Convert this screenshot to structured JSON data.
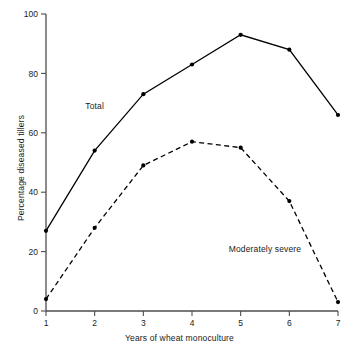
{
  "chart_data": {
    "type": "line",
    "title": "",
    "xlabel": "Years of wheat monoculture",
    "ylabel": "Percentage diseased tillers",
    "x": [
      1,
      2,
      3,
      4,
      5,
      6,
      7
    ],
    "xticklabels": [
      "1",
      "2",
      "3",
      "4",
      "5",
      "6",
      "7"
    ],
    "yticks": [
      0,
      20,
      40,
      60,
      80,
      100
    ],
    "yticklabels": [
      "0",
      "20",
      "40",
      "60",
      "80",
      "100"
    ],
    "xlim": [
      1,
      7
    ],
    "ylim": [
      0,
      100
    ],
    "grid": false,
    "legend_position": "inline-annotation",
    "series": [
      {
        "name": "Total",
        "values": [
          27,
          54,
          73,
          83,
          93,
          88,
          66
        ],
        "linestyle": "solid",
        "marker": "filled-circle",
        "color": "#000000",
        "label_x": 2.0,
        "label_y": 68
      },
      {
        "name": "Moderately severe",
        "values": [
          4,
          28,
          49,
          57,
          55,
          37,
          3
        ],
        "linestyle": "dashed",
        "marker": "filled-circle",
        "color": "#000000",
        "label_x": 5.5,
        "label_y": 20
      }
    ],
    "annotations": [
      {
        "text": "Total",
        "x": 2.0,
        "y": 68
      },
      {
        "text": "Moderately severe",
        "x": 5.5,
        "y": 20
      }
    ],
    "axis_color": "#4d4d4d",
    "plot_background": "#ffffff"
  }
}
